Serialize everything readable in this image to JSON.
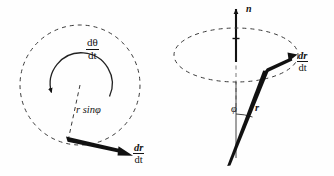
{
  "figure": {
    "background_color": "#fefefe",
    "ink_color": "#141414",
    "panels": [
      {
        "id": "left-panel",
        "name": "top-view-circle-panel",
        "description": "Dashed circle of radius r sin phi viewed from above, with angular-rate arc arrow and velocity vector",
        "elements": {
          "dashed_circle": {
            "cx": 80,
            "cy": 85,
            "r": 60,
            "dash": "4 4"
          },
          "dashed_radius": {
            "x1": 80,
            "y1": 85,
            "x2": 68,
            "y2": 141
          },
          "arc_arrow": {
            "cx": 80,
            "cy": 85,
            "r": 31,
            "start_deg": 200,
            "end_deg": 355
          },
          "velocity_arrow": {
            "x1": 67,
            "y1": 139,
            "x2": 131,
            "y2": 156
          }
        },
        "labels": {
          "angular_rate_num": "dθ",
          "angular_rate_den": "dt",
          "radius": "r sinφ",
          "radius_symbol": "r",
          "radius_function": "sin",
          "radius_angle": "φ",
          "velocity_num": "dr",
          "velocity_den": "dt"
        }
      },
      {
        "id": "right-panel",
        "name": "side-view-cone-panel",
        "description": "Vertical rotation axis n with dashed ellipse, position vector r at angle phi, and its time derivative",
        "elements": {
          "axis_arrow": {
            "x1": 236,
            "y1": 62,
            "x2": 236,
            "y2": 6
          },
          "axis_dashed_lower": {
            "x1": 236,
            "y1": 62,
            "x2": 236,
            "y2": 110
          },
          "dashed_ellipse": {
            "cx": 236,
            "cy": 55,
            "rx": 62,
            "ry": 27,
            "dash": "4 4"
          },
          "r_vector": {
            "x1": 228,
            "y1": 166,
            "x2": 266,
            "y2": 70
          },
          "drdt_arrow": {
            "x1": 264,
            "y1": 72,
            "x2": 296,
            "y2": 55
          },
          "phi_arc": {
            "cx": 236,
            "cy": 60,
            "r": 48,
            "start_deg": 90,
            "end_deg": 68
          }
        },
        "labels": {
          "axis": "n",
          "angle": "φ",
          "position_vector": "r",
          "derivative_num": "dr",
          "derivative_den": "dt"
        }
      }
    ]
  }
}
